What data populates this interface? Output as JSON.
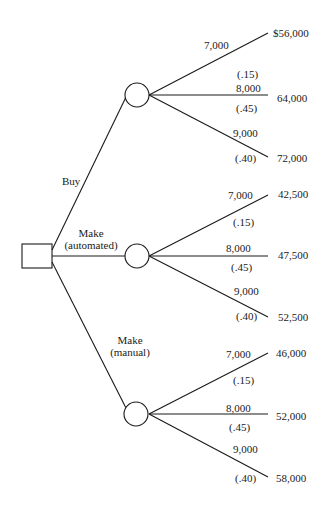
{
  "diagram": {
    "type": "decision-tree",
    "decision_node": {
      "shape": "square"
    },
    "alternatives": [
      {
        "label_lines": [
          "Buy"
        ],
        "outcomes": [
          {
            "demand": "7,000",
            "probability": "(.15)",
            "payoff": "$56,000"
          },
          {
            "demand": "8,000",
            "probability": "(.45)",
            "payoff": "64,000"
          },
          {
            "demand": "9,000",
            "probability": "(.40)",
            "payoff": "72,000"
          }
        ]
      },
      {
        "label_lines": [
          "Make",
          "(automated)"
        ],
        "outcomes": [
          {
            "demand": "7,000",
            "probability": "(.15)",
            "payoff": "42,500"
          },
          {
            "demand": "8,000",
            "probability": "(.45)",
            "payoff": "47,500"
          },
          {
            "demand": "9,000",
            "probability": "(.40)",
            "payoff": "52,500"
          }
        ]
      },
      {
        "label_lines": [
          "Make",
          "(manual)"
        ],
        "outcomes": [
          {
            "demand": "7,000",
            "probability": "(.15)",
            "payoff": "46,000"
          },
          {
            "demand": "8,000",
            "probability": "(.45)",
            "payoff": "52,000"
          },
          {
            "demand": "9,000",
            "probability": "(.40)",
            "payoff": "58,000"
          }
        ]
      }
    ]
  }
}
